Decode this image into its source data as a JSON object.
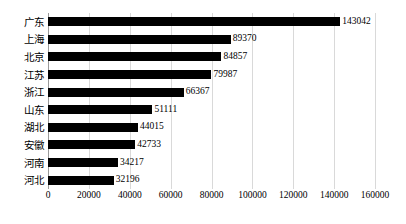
{
  "chart_data": {
    "type": "bar",
    "orientation": "horizontal",
    "title": "",
    "subtitle": "",
    "xlabel": "",
    "ylabel": "",
    "xlim": [
      0,
      160000
    ],
    "ylim": null,
    "grid": true,
    "legend": null,
    "legend_position": "none",
    "categories": [
      "广东",
      "上海",
      "北京",
      "江苏",
      "浙江",
      "山东",
      "湖北",
      "安徽",
      "河南",
      "河北"
    ],
    "values": [
      143042,
      89370,
      84857,
      79987,
      66367,
      51111,
      44015,
      42733,
      34217,
      32196
    ],
    "value_labels": [
      "143042",
      "89370",
      "84857",
      "79987",
      "66367",
      "51111",
      "44015",
      "42733",
      "34217",
      "32196"
    ],
    "xticks": [
      0,
      20000,
      40000,
      60000,
      80000,
      100000,
      120000,
      140000,
      160000
    ],
    "xtick_labels": [
      "0",
      "20000",
      "40000",
      "60000",
      "80000",
      "100000",
      "120000",
      "140000",
      "160000"
    ],
    "bar_color": "#000000",
    "grid_color": "#d9d9d9",
    "axis_color": "#9a9a9a",
    "background_color": "#ffffff"
  }
}
